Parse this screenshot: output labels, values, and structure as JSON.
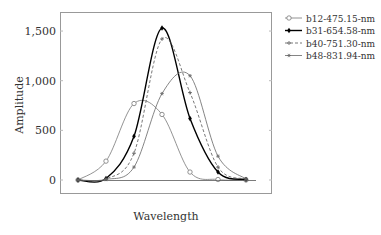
{
  "chart_data": {
    "type": "line",
    "title": "",
    "xlabel": "Wavelength",
    "ylabel": "Amplitude",
    "x": [
      0,
      1,
      2,
      3,
      4,
      5,
      6
    ],
    "ylim": [
      -80,
      1700
    ],
    "yticks": [
      0,
      500,
      1000,
      1500
    ],
    "ytick_labels": [
      "0",
      "500",
      "1,000",
      "1,500"
    ],
    "grid": false,
    "legend_position": "outside-right-top",
    "series": [
      {
        "name": "b12-475.15-nm",
        "marker": "circle-open",
        "style": "thin-solid",
        "color": "#777777",
        "values": [
          0,
          190,
          770,
          660,
          80,
          5,
          0
        ]
      },
      {
        "name": "b31-654.58-nm",
        "marker": "diamond-filled",
        "style": "thick-solid",
        "color": "#000000",
        "values": [
          0,
          15,
          440,
          1530,
          620,
          80,
          5
        ]
      },
      {
        "name": "b40-751.30-nm",
        "marker": "plus",
        "style": "dashed",
        "color": "#555555",
        "values": [
          0,
          10,
          270,
          1420,
          880,
          130,
          10
        ]
      },
      {
        "name": "b48-831.94-nm",
        "marker": "asterisk",
        "style": "thin-solid",
        "color": "#666666",
        "values": [
          0,
          5,
          130,
          870,
          1050,
          240,
          10
        ]
      }
    ]
  }
}
